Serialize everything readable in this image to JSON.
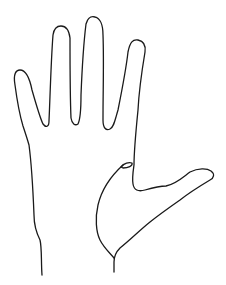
{
  "figure": {
    "background": "#ffffff",
    "stroke_color": "#1a1a1a",
    "parts": [
      "little-finger",
      "ring-finger",
      "middle-finger",
      "index-finger",
      "thumb",
      "wrist"
    ]
  }
}
